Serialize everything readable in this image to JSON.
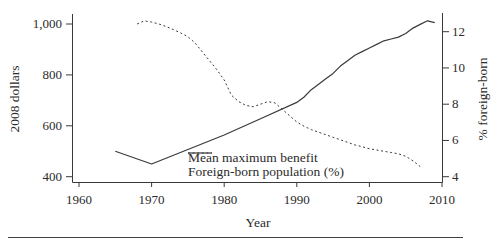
{
  "figure": {
    "background": "#ffffff",
    "line_color": "#3a3a3a",
    "text_color": "#2b2b2b",
    "bottom_rule_color": "#3f3f3f"
  },
  "chart_data": {
    "type": "line",
    "title": "",
    "xlabel": "Year",
    "ylabel_left": "2008 dollars",
    "ylabel_right": "% foreign-born",
    "grid": "off",
    "x_axis": {
      "range": [
        1959,
        2010
      ],
      "ticks": [
        1960,
        1970,
        1980,
        1990,
        2000,
        2010
      ]
    },
    "y_left_axis": {
      "range": [
        378,
        1040
      ],
      "ticks": [
        {
          "value": 1000,
          "label": "1,000"
        },
        {
          "value": 800,
          "label": "800"
        },
        {
          "value": 600,
          "label": "600"
        },
        {
          "value": 400,
          "label": "400"
        }
      ]
    },
    "y_right_axis": {
      "range": [
        3.7,
        13.0
      ],
      "ticks": [
        {
          "value": 12,
          "label": "12"
        },
        {
          "value": 10,
          "label": "10"
        },
        {
          "value": 8,
          "label": "8"
        },
        {
          "value": 6,
          "label": "6"
        },
        {
          "value": 4,
          "label": "4"
        }
      ]
    },
    "legend": {
      "position": "inside-bottom-center",
      "items": [
        {
          "label": "Mean maximum benefit",
          "style": "dashed"
        },
        {
          "label": "Foreign-born population (%)",
          "style": "solid"
        }
      ]
    },
    "series": [
      {
        "name": "Mean maximum benefit",
        "axis": "left",
        "style": "dashed",
        "points": [
          [
            1968,
            1000
          ],
          [
            1969,
            1012
          ],
          [
            1970,
            1008
          ],
          [
            1971,
            1000
          ],
          [
            1972,
            990
          ],
          [
            1973,
            978
          ],
          [
            1974,
            965
          ],
          [
            1975,
            950
          ],
          [
            1976,
            925
          ],
          [
            1977,
            890
          ],
          [
            1978,
            855
          ],
          [
            1979,
            820
          ],
          [
            1980,
            780
          ],
          [
            1981,
            720
          ],
          [
            1982,
            695
          ],
          [
            1983,
            680
          ],
          [
            1984,
            675
          ],
          [
            1985,
            685
          ],
          [
            1986,
            695
          ],
          [
            1987,
            690
          ],
          [
            1988,
            665
          ],
          [
            1989,
            640
          ],
          [
            1990,
            615
          ],
          [
            1991,
            598
          ],
          [
            1992,
            585
          ],
          [
            1993,
            575
          ],
          [
            1994,
            565
          ],
          [
            1995,
            555
          ],
          [
            1996,
            545
          ],
          [
            1997,
            535
          ],
          [
            1998,
            525
          ],
          [
            1999,
            518
          ],
          [
            2000,
            510
          ],
          [
            2001,
            505
          ],
          [
            2002,
            500
          ],
          [
            2003,
            495
          ],
          [
            2004,
            490
          ],
          [
            2005,
            480
          ],
          [
            2006,
            462
          ],
          [
            2007,
            440
          ]
        ]
      },
      {
        "name": "Foreign-born population (%)",
        "axis": "right",
        "style": "solid",
        "points": [
          [
            1965,
            5.4
          ],
          [
            1970,
            4.7
          ],
          [
            1975,
            5.5
          ],
          [
            1980,
            6.3
          ],
          [
            1985,
            7.2
          ],
          [
            1990,
            8.1
          ],
          [
            1991,
            8.4
          ],
          [
            1992,
            8.8
          ],
          [
            1993,
            9.1
          ],
          [
            1994,
            9.4
          ],
          [
            1995,
            9.7
          ],
          [
            1996,
            10.1
          ],
          [
            1997,
            10.4
          ],
          [
            1998,
            10.7
          ],
          [
            1999,
            10.9
          ],
          [
            2000,
            11.1
          ],
          [
            2001,
            11.3
          ],
          [
            2002,
            11.5
          ],
          [
            2003,
            11.6
          ],
          [
            2004,
            11.7
          ],
          [
            2005,
            11.9
          ],
          [
            2006,
            12.2
          ],
          [
            2007,
            12.4
          ],
          [
            2008,
            12.6
          ],
          [
            2009,
            12.5
          ]
        ]
      }
    ]
  }
}
